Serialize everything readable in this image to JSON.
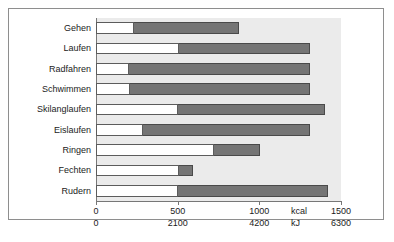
{
  "chart_data": {
    "type": "bar",
    "orientation": "horizontal",
    "stacked": true,
    "title": "",
    "xlabel": "",
    "ylabel": "",
    "grid": false,
    "legend": "none",
    "categories": [
      "Gehen",
      "Laufen",
      "Radfahren",
      "Schwimmen",
      "Skilanglaufen",
      "Eislaufen",
      "Ringen",
      "Fechten",
      "Rudern"
    ],
    "series": [
      {
        "name": "untere Grenze",
        "fill": "#ffffff",
        "values": [
          230,
          510,
          200,
          210,
          505,
          285,
          720,
          510,
          505
        ]
      },
      {
        "name": "obere Grenze",
        "fill": "#757575",
        "values": [
          875,
          1310,
          1310,
          1310,
          1400,
          1310,
          1005,
          595,
          1420
        ]
      }
    ],
    "axes": [
      {
        "unit": "kcal",
        "ticks": [
          "0",
          "500",
          "1000",
          "1500"
        ],
        "tick_values": [
          0,
          500,
          1000,
          1500
        ],
        "xlim": [
          0,
          1500
        ]
      },
      {
        "unit": "kJ",
        "ticks": [
          "0",
          "2100",
          "4200",
          "6300"
        ],
        "tick_values": [
          0,
          2100,
          4200,
          6300
        ],
        "xlim": [
          0,
          6300
        ]
      }
    ],
    "colors": {
      "plot_background": "#ebebeb",
      "bar_light": "#ffffff",
      "bar_dark": "#757575",
      "axis": "#777777",
      "frame": "#8e8e8e",
      "text": "#1b1b1b"
    }
  }
}
